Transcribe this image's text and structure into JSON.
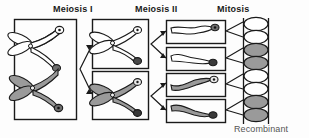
{
  "figure": {
    "headers": {
      "meiosis_1": "Meiosis I",
      "meiosis_2": "Meiosis II",
      "mitosis": "Mitosis"
    },
    "annotation": {
      "recombinant": "Recombinant"
    },
    "colors": {
      "outline": "#1a1a1a",
      "white_chromatid": "#ffffff",
      "gray_chromatid": "#9a9a9a",
      "background": "#fdfdfd",
      "label_text": "#1a1a1a",
      "annotation_text": "#555555"
    },
    "parent_cell": {
      "chromosomes": [
        {
          "shade": "white",
          "shape": "x-tetrad",
          "crossover": true
        },
        {
          "shade": "gray",
          "shape": "x-tetrad",
          "crossover": true
        }
      ]
    },
    "meiosis_1_cells": [
      {
        "shade": "white",
        "shape": "x-dyad"
      },
      {
        "shade": "gray",
        "shape": "x-dyad"
      }
    ],
    "meiosis_2_cells": [
      {
        "shade": "white",
        "shape": "bent-rod"
      },
      {
        "shade": "white",
        "shape": "bent-rod"
      },
      {
        "shade": "gray",
        "shape": "bent-rod"
      },
      {
        "shade": "gray",
        "shape": "bent-rod"
      }
    ],
    "mitosis_products": [
      {
        "index": 1,
        "shade": "white"
      },
      {
        "index": 2,
        "shade": "white"
      },
      {
        "index": 3,
        "shade": "gray"
      },
      {
        "index": 4,
        "shade": "gray"
      },
      {
        "index": 5,
        "shade": "white"
      },
      {
        "index": 6,
        "shade": "white"
      },
      {
        "index": 7,
        "shade": "gray"
      },
      {
        "index": 8,
        "shade": "gray"
      }
    ],
    "counts": {
      "parent_cells": 1,
      "meiosis_1_cells": 2,
      "meiosis_2_cells": 4,
      "mitosis_products": 8
    }
  }
}
